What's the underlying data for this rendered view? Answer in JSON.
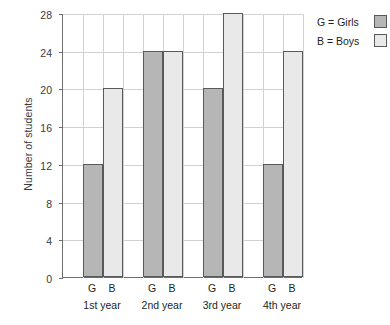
{
  "chart_data": {
    "type": "bar",
    "title": "",
    "xlabel": "",
    "ylabel": "Number of students",
    "ylim": [
      0,
      28
    ],
    "yticks": [
      0,
      4,
      8,
      12,
      16,
      20,
      24,
      28
    ],
    "ytick_labels": [
      "0",
      "4",
      "8",
      "12",
      "16",
      "20",
      "24",
      "28"
    ],
    "grid": true,
    "legend_position": "right",
    "categories": [
      "1st year",
      "2nd year",
      "3rd year",
      "4th year"
    ],
    "subcategory_labels": [
      "G",
      "B"
    ],
    "series": [
      {
        "name": "G = Girls",
        "key": "G",
        "color": "#b6b6b6",
        "values": [
          12,
          24,
          20,
          12
        ]
      },
      {
        "name": "B = Boys",
        "key": "B",
        "color": "#e9e9e9",
        "values": [
          20,
          24,
          28,
          24
        ]
      }
    ],
    "legend": [
      {
        "label": "G = Girls",
        "color": "#b6b6b6"
      },
      {
        "label": "B = Boys",
        "color": "#e9e9e9"
      }
    ]
  },
  "axis": {
    "y_title": "Number of students"
  },
  "colors": {
    "girls_fill": "#b6b6b6",
    "boys_fill": "#e9e9e9",
    "bar_border": "#58595b",
    "gridline": "#d2d2d2",
    "axis_line": "#6d6d6d",
    "text": "#231f20"
  }
}
